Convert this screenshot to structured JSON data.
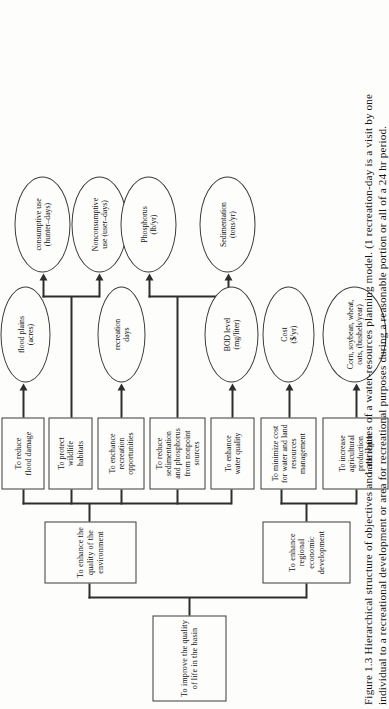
{
  "figure": {
    "number": "Figure 1.3",
    "caption_line1": "Figure 1.3  Hierarchical structure of objectives and attributes of a water-resources planning model. (1 recreation-day is a visit by one",
    "caption_line2": "individual to a recreational development or area for recreational purposes during a reasonable portion or all of a 24 hr period."
  },
  "tree": {
    "root": {
      "id": "root",
      "label": "To improve the quality of life in the basin"
    },
    "level2": [
      {
        "id": "env",
        "label": "To enhance the quality of the environment"
      },
      {
        "id": "econ",
        "label": "To enhance regional economic development"
      }
    ],
    "level3": [
      {
        "id": "flood",
        "parent": "env",
        "label": "To reduce\nflood damage"
      },
      {
        "id": "wildlife",
        "parent": "env",
        "label": "To protect\nwildlife\nhabitats"
      },
      {
        "id": "rec",
        "parent": "env",
        "label": "To enchance\nrecreation\nopportunities"
      },
      {
        "id": "sedim",
        "parent": "env",
        "label": "To reduce\nsedimentation\nand phosphorus\nfrom nonpoint\nsources"
      },
      {
        "id": "water",
        "parent": "env",
        "label": "To enhance\nwater quality"
      },
      {
        "id": "cost",
        "parent": "econ",
        "label": "To minimize cost\nfor water and land\nresources management"
      },
      {
        "id": "agri",
        "parent": "econ",
        "label": "To increase\nagricultural production\nin the region"
      }
    ],
    "attributes": [
      {
        "id": "a-floodplains",
        "from": "flood",
        "label": "flood plains\n(acres)"
      },
      {
        "id": "a-consumptive",
        "from": "wildlife",
        "label": "consumptive use\n(hunter–days)"
      },
      {
        "id": "a-nonconsump",
        "from": "wildlife",
        "label": "Nonconsumptive\nuse (user–days)"
      },
      {
        "id": "a-recdays",
        "from": "rec",
        "label": "recreation\ndays"
      },
      {
        "id": "a-phosphorus",
        "from": "sedim",
        "label": "Phosphorus\n(lb/yr)"
      },
      {
        "id": "a-sedimentation",
        "from": "sedim",
        "label": "Sedimentation\n(tons/yr)"
      },
      {
        "id": "a-bod",
        "from": "water",
        "label": "BOD level\n(mg/liter)"
      },
      {
        "id": "a-cost",
        "from": "cost",
        "label": "Cost\n($/yr)"
      },
      {
        "id": "a-crops",
        "from": "agri",
        "label": "Corn, soybean, wheat,\noats, (bushels/year)"
      }
    ]
  },
  "style": {
    "line_color": "#2e2e2e",
    "box_border": "#3a3a3a",
    "page_bg": "#fdfdfb"
  }
}
